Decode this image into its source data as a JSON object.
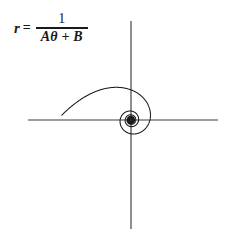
{
  "figure": {
    "background_color": "#ffffff",
    "stroke_color": "#1a1a1a"
  },
  "equation": {
    "variable": "r",
    "relation": "=",
    "numerator": "1",
    "denominator": "Aθ + B",
    "full_text": "r = 1/(Aθ + B)"
  },
  "axes": {
    "origin_x": 131,
    "origin_y": 120,
    "x_axis": {
      "name": "horizontal-axis",
      "x1": 28,
      "y1": 120,
      "x2": 218,
      "y2": 120
    },
    "y_axis": {
      "name": "vertical-axis",
      "x1": 131,
      "y1": 21,
      "x2": 131,
      "y2": 229
    },
    "line_width": 1.1,
    "color": "#3c3c3c"
  },
  "chart_data": {
    "type": "line",
    "curve": "hyperbolic spiral",
    "equation": "r = 1/(A*theta + B)",
    "coordinate_system": "polar",
    "parameters": {
      "A": 0.0125,
      "B": 0.0057
    },
    "theta_range_deg": [
      40,
      4600
    ],
    "xlabel": "",
    "ylabel": "",
    "grid": false,
    "legend": false,
    "center_px": [
      131,
      120
    ],
    "scale_px_per_unit": 1.0,
    "tail_end_px": [
      25,
      156
    ],
    "outer_extents_px": {
      "top": 42,
      "bottom": 222,
      "left": 36,
      "right": 216
    },
    "x_axis_crossings_px": [
      36,
      60,
      79,
      93,
      103,
      110,
      115,
      119,
      121,
      123,
      125,
      126,
      127,
      216,
      188,
      168,
      154,
      144,
      138,
      143,
      137,
      135,
      134,
      133
    ],
    "turns_visible": 12
  }
}
